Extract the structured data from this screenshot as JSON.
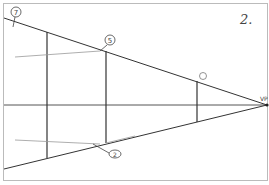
{
  "figure": {
    "number": "2.",
    "vanishing_point_label": "VP",
    "labels": [
      {
        "id": "label-7",
        "text": "7",
        "x": 16,
        "y": 10
      },
      {
        "id": "label-5",
        "text": "5",
        "x": 110,
        "y": 38
      },
      {
        "id": "label-6-or-1",
        "text": "1",
        "x": 203,
        "y": 75
      },
      {
        "id": "label-2",
        "text": "2",
        "x": 115,
        "y": 153
      }
    ],
    "colors": {
      "stroke": "#333333",
      "faint": "#999999",
      "frame": "#bbbbbb",
      "background": "#ffffff"
    }
  }
}
